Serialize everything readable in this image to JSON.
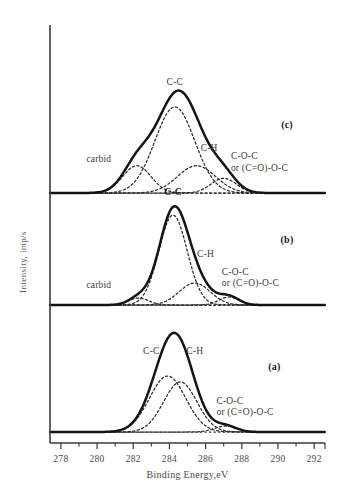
{
  "figure": {
    "background": "#ffffff",
    "envelope_color": "#141414",
    "component_color": "#2b2b2b",
    "axis_color": "#3b3b3b"
  },
  "chart_data": {
    "type": "line",
    "title": "",
    "xlabel": "Binding Energy,eV",
    "ylabel": "Intensity, imp/s",
    "xlim": [
      277.4,
      292.6
    ],
    "xticks": [
      278,
      280,
      282,
      284,
      286,
      288,
      290,
      292
    ],
    "xtick_labels": [
      "278",
      "280",
      "282",
      "284",
      "286",
      "288",
      "290",
      "292"
    ],
    "minor_xticks": [
      279,
      281,
      283,
      285,
      287,
      289,
      291
    ],
    "grid": false,
    "legend": "none",
    "panels": [
      {
        "id": "c",
        "label": "(c)",
        "label_x": 290.5,
        "baseline_from": 277.8,
        "baseline_to": 291.2,
        "envelope": {
          "name": "envelope",
          "style": "solid"
        },
        "components": [
          {
            "name": "carbid",
            "center": 282.2,
            "width": 0.78,
            "height": 0.26
          },
          {
            "name": "C-C",
            "center": 284.3,
            "width": 1.1,
            "height": 0.82
          },
          {
            "name": "C-H",
            "center": 285.5,
            "width": 1.05,
            "height": 0.26
          },
          {
            "name": "C-O-C",
            "center": 287.0,
            "width": 0.7,
            "height": 0.14
          }
        ],
        "annotations": [
          {
            "text": "C-C",
            "x": 284.3,
            "y": 1.03,
            "bold": false,
            "align": "middle"
          },
          {
            "text": "C-H",
            "x": 286.2,
            "y": 0.4,
            "bold": false,
            "align": "middle"
          },
          {
            "text": "carbid",
            "x": 280.1,
            "y": 0.3,
            "bold": false,
            "align": "middle"
          },
          {
            "text": "C-O-C",
            "x": 287.4,
            "y": 0.32,
            "bold": false,
            "align": "start"
          },
          {
            "text": "or (C=O)-O-C",
            "x": 287.4,
            "y": 0.21,
            "bold": false,
            "align": "start"
          }
        ]
      },
      {
        "id": "b",
        "label": "(b)",
        "label_x": 290.5,
        "baseline_from": 277.8,
        "baseline_to": 291.6,
        "envelope": {
          "name": "envelope",
          "style": "solid"
        },
        "components": [
          {
            "name": "carbid",
            "center": 282.3,
            "width": 0.55,
            "height": 0.07
          },
          {
            "name": "C-C",
            "center": 284.2,
            "width": 0.78,
            "height": 0.9
          },
          {
            "name": "C-H",
            "center": 285.4,
            "width": 0.85,
            "height": 0.22
          },
          {
            "name": "C-O-C",
            "center": 287.3,
            "width": 0.55,
            "height": 0.08
          }
        ],
        "annotations": [
          {
            "text": "C-C",
            "x": 284.2,
            "y": 1.1,
            "bold": true,
            "align": "middle"
          },
          {
            "text": "C-H",
            "x": 286.0,
            "y": 0.48,
            "bold": false,
            "align": "middle"
          },
          {
            "text": "carbid",
            "x": 280.1,
            "y": 0.17,
            "bold": false,
            "align": "middle"
          },
          {
            "text": "C-O-C",
            "x": 286.9,
            "y": 0.3,
            "bold": false,
            "align": "start"
          },
          {
            "text": "or (C=O)-O-C",
            "x": 286.9,
            "y": 0.19,
            "bold": false,
            "align": "start"
          }
        ]
      },
      {
        "id": "a",
        "label": "(a)",
        "label_x": 289.8,
        "baseline_from": 277.8,
        "baseline_to": 291.0,
        "envelope": {
          "name": "envelope",
          "style": "solid"
        },
        "components": [
          {
            "name": "C-C",
            "center": 283.9,
            "width": 1.0,
            "height": 0.56
          },
          {
            "name": "C-H",
            "center": 284.6,
            "width": 0.92,
            "height": 0.5
          },
          {
            "name": "C-O-C",
            "center": 287.1,
            "width": 0.6,
            "height": 0.06
          }
        ],
        "annotations": [
          {
            "text": "C-C",
            "x": 283.0,
            "y": 0.78,
            "bold": false,
            "align": "middle"
          },
          {
            "text": "C-H",
            "x": 285.4,
            "y": 0.78,
            "bold": false,
            "align": "middle"
          },
          {
            "text": "C-O-C",
            "x": 286.6,
            "y": 0.28,
            "bold": false,
            "align": "start"
          },
          {
            "text": "or (C=O)-O-C",
            "x": 286.6,
            "y": 0.17,
            "bold": false,
            "align": "start"
          }
        ]
      }
    ]
  }
}
